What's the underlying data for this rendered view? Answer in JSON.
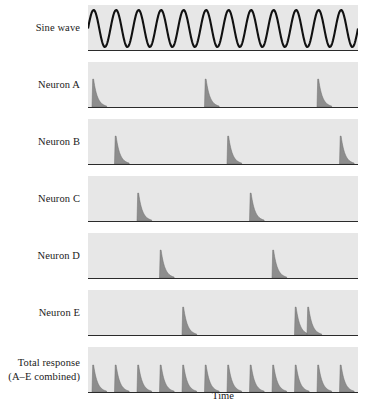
{
  "figure": {
    "x_axis_label": "Time",
    "row_labels": [
      {
        "name": "sine-wave",
        "lines": [
          "Sine wave"
        ]
      },
      {
        "name": "neuron-a",
        "lines": [
          "Neuron A"
        ]
      },
      {
        "name": "neuron-b",
        "lines": [
          "Neuron B"
        ]
      },
      {
        "name": "neuron-c",
        "lines": [
          "Neuron C"
        ]
      },
      {
        "name": "neuron-d",
        "lines": [
          "Neuron D"
        ]
      },
      {
        "name": "neuron-e",
        "lines": [
          "Neuron E"
        ]
      },
      {
        "name": "total-response",
        "lines": [
          "Total response",
          "(A–E combined)"
        ]
      }
    ]
  },
  "chart_data": {
    "type": "line",
    "title": "",
    "xlabel": "Time",
    "ylabel": "",
    "grid": false,
    "legend": "none",
    "panel_geometry": {
      "plot_left_px": 88,
      "plot_width_px": 270,
      "plot_height_px": 45,
      "row_tops_px": [
        5,
        62,
        119,
        176,
        233,
        290,
        347
      ],
      "row_pitch_px": 57
    },
    "stimulus": {
      "name": "Sine wave",
      "waveform": "sine",
      "cycles": 12,
      "period_px": 22.5,
      "phase_deg": 0,
      "amplitude_frac": 0.82,
      "stroke_color": "#111111",
      "stroke_width": 2.1
    },
    "spike_shape": {
      "rise_px": 1.6,
      "decay_px": 13,
      "peak_height_frac": 0.62,
      "fill_color": "#8d8d8d",
      "edge_color": "#6f6f6f"
    },
    "neuron_period_px": 112.5,
    "neuron_phase_step_px": 22.5,
    "series": [
      {
        "name": "Neuron A",
        "first_spike_px": 4,
        "spike_positions_px": [
          4,
          116.5,
          229,
          341.5
        ],
        "spike_count_visible": 3
      },
      {
        "name": "Neuron B",
        "first_spike_px": 26.5,
        "spike_positions_px": [
          26.5,
          139,
          251.5
        ],
        "spike_count_visible": 3
      },
      {
        "name": "Neuron C",
        "first_spike_px": 49,
        "spike_positions_px": [
          49,
          161.5,
          274
        ],
        "spike_count_visible": 2
      },
      {
        "name": "Neuron D",
        "first_spike_px": 71.5,
        "spike_positions_px": [
          71.5,
          184,
          296.5
        ],
        "spike_count_visible": 2
      },
      {
        "name": "Neuron E",
        "first_spike_px": 94,
        "spike_positions_px": [
          94,
          206.5,
          219
        ],
        "spike_count_visible": 2
      }
    ],
    "total_response": {
      "name": "Total response (A–E combined)",
      "spike_count": 12,
      "spacing_px": 22.5,
      "first_spike_px": 4,
      "peak_height_frac": 0.6
    },
    "colors": {
      "panel_background": "#e7e7e7",
      "axis": "#2b2b2b",
      "text": "#1a1a1a",
      "spike_fill": "#8d8d8d",
      "sine_stroke": "#111111"
    }
  }
}
